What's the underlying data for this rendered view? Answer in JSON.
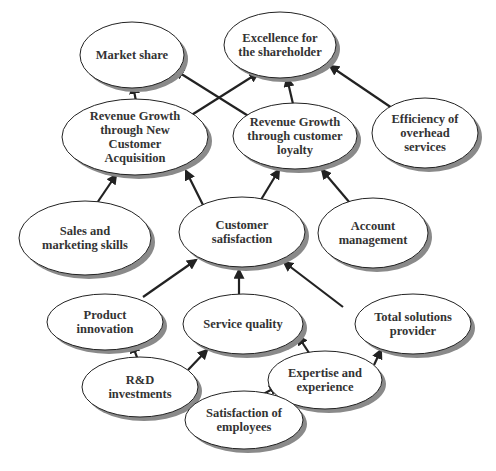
{
  "diagram": {
    "type": "strategy-map",
    "nodes": [
      {
        "id": "market_share",
        "label": "Market share",
        "cx": 132,
        "cy": 55,
        "rx": 52,
        "ry": 33
      },
      {
        "id": "excellence",
        "label": "Excellence for the shareholder",
        "cx": 280,
        "cy": 45,
        "rx": 56,
        "ry": 33
      },
      {
        "id": "rev_new",
        "label": "Revenue Growth through New Customer Acquisition",
        "cx": 135,
        "cy": 137,
        "rx": 73,
        "ry": 38
      },
      {
        "id": "rev_loyalty",
        "label": "Revenue Growth through customer loyalty",
        "cx": 295,
        "cy": 136,
        "rx": 62,
        "ry": 33
      },
      {
        "id": "overhead",
        "label": "Efficiency of overhead services",
        "cx": 425,
        "cy": 133,
        "rx": 53,
        "ry": 35
      },
      {
        "id": "sales",
        "label": "Sales and marketing skills",
        "cx": 85,
        "cy": 238,
        "rx": 66,
        "ry": 37
      },
      {
        "id": "cust_sat",
        "label": "Customer safisfaction",
        "cx": 242,
        "cy": 232,
        "rx": 63,
        "ry": 35
      },
      {
        "id": "account",
        "label": "Account management",
        "cx": 373,
        "cy": 233,
        "rx": 55,
        "ry": 35
      },
      {
        "id": "product",
        "label": "Product innovation",
        "cx": 105,
        "cy": 322,
        "rx": 58,
        "ry": 28
      },
      {
        "id": "service",
        "label": "Service quality",
        "cx": 243,
        "cy": 324,
        "rx": 60,
        "ry": 30
      },
      {
        "id": "total",
        "label": "Total solutions provider",
        "cx": 413,
        "cy": 324,
        "rx": 58,
        "ry": 30
      },
      {
        "id": "rd",
        "label": "R&D investments",
        "cx": 140,
        "cy": 387,
        "rx": 58,
        "ry": 30
      },
      {
        "id": "expertise",
        "label": "Expertise and experience",
        "cx": 325,
        "cy": 380,
        "rx": 57,
        "ry": 29
      },
      {
        "id": "employees",
        "label": "Satisfaction of employees",
        "cx": 244,
        "cy": 420,
        "rx": 59,
        "ry": 29
      }
    ],
    "edges": [
      {
        "from": "rev_new",
        "to": "market_share",
        "x1": 137,
        "y1": 107,
        "x2": 133,
        "y2": 85
      },
      {
        "from": "rev_loyalty",
        "to": "market_share",
        "x1": 250,
        "y1": 117,
        "x2": 175,
        "y2": 70
      },
      {
        "from": "rev_new",
        "to": "excellence",
        "x1": 190,
        "y1": 116,
        "x2": 258,
        "y2": 73
      },
      {
        "from": "rev_loyalty",
        "to": "excellence",
        "x1": 293,
        "y1": 104,
        "x2": 287,
        "y2": 78
      },
      {
        "from": "overhead",
        "to": "excellence",
        "x1": 392,
        "y1": 108,
        "x2": 330,
        "y2": 66
      },
      {
        "from": "sales",
        "to": "rev_new",
        "x1": 97,
        "y1": 203,
        "x2": 116,
        "y2": 175
      },
      {
        "from": "cust_sat",
        "to": "rev_new",
        "x1": 205,
        "y1": 209,
        "x2": 186,
        "y2": 171
      },
      {
        "from": "cust_sat",
        "to": "rev_loyalty",
        "x1": 259,
        "y1": 203,
        "x2": 279,
        "y2": 170
      },
      {
        "from": "account",
        "to": "rev_loyalty",
        "x1": 350,
        "y1": 203,
        "x2": 322,
        "y2": 170
      },
      {
        "from": "product",
        "to": "cust_sat",
        "x1": 143,
        "y1": 297,
        "x2": 196,
        "y2": 260
      },
      {
        "from": "service",
        "to": "cust_sat",
        "x1": 239,
        "y1": 294,
        "x2": 239,
        "y2": 270
      },
      {
        "from": "total",
        "to": "cust_sat",
        "x1": 343,
        "y1": 307,
        "x2": 284,
        "y2": 262
      },
      {
        "from": "rd",
        "to": "product",
        "x1": 138,
        "y1": 360,
        "x2": 132,
        "y2": 344
      },
      {
        "from": "rd",
        "to": "service",
        "x1": 188,
        "y1": 370,
        "x2": 207,
        "y2": 350
      },
      {
        "from": "expertise",
        "to": "service",
        "x1": 313,
        "y1": 359,
        "x2": 298,
        "y2": 336
      },
      {
        "from": "expertise",
        "to": "total",
        "x1": 374,
        "y1": 365,
        "x2": 381,
        "y2": 350
      },
      {
        "from": "employees",
        "to": "expertise",
        "x1": 258,
        "y1": 397,
        "x2": 278,
        "y2": 386
      }
    ]
  }
}
